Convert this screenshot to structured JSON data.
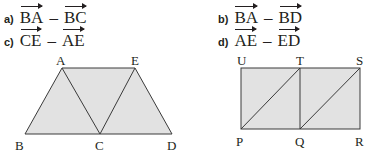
{
  "exercises": [
    {
      "label": "a)",
      "left": "BA",
      "op": "–",
      "right": "BC"
    },
    {
      "label": "b)",
      "left": "BA",
      "op": "–",
      "right": "BD"
    },
    {
      "label": "c)",
      "left": "CE",
      "op": "–",
      "right": "AE"
    },
    {
      "label": "d)",
      "left": "AE",
      "op": "–",
      "right": "ED"
    }
  ],
  "figure1": {
    "vertices": {
      "A": "A",
      "B": "B",
      "C": "C",
      "D": "D",
      "E": "E"
    },
    "fill": "#e2e2e2",
    "stroke": "#3a3a3a"
  },
  "figure2": {
    "vertices": {
      "U": "U",
      "T": "T",
      "S": "S",
      "P": "P",
      "Q": "Q",
      "R": "R"
    },
    "fill": "#e2e2e2",
    "stroke": "#3a3a3a"
  }
}
